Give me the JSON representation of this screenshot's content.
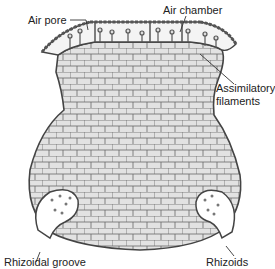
{
  "diagram": {
    "labels": {
      "air_pore": "Air pore",
      "air_chamber": "Air chamber",
      "assimilatory_1": "Assimilatory",
      "assimilatory_2": "filaments",
      "rhizoidal_groove": "Rhizoidal groove",
      "rhizoids": "Rhizoids"
    },
    "colors": {
      "cell_fill": "#d9d9d9",
      "cell_stroke": "#555555",
      "outline": "#444444",
      "text": "#222222"
    }
  }
}
